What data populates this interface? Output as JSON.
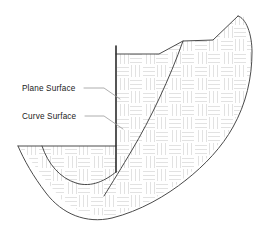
{
  "diagram": {
    "background_color": "#ffffff",
    "outline_color": "#4a4a4a",
    "emphasis_color": "#2b2b2b",
    "hatch_color": "#e2e2e2",
    "leader_color": "#9a9a9a",
    "labels": [
      {
        "id": "plane-surface",
        "text": "Plane Surface",
        "x": 22,
        "y": 91,
        "leader": "M 84 88 L 104 88 L 120 99"
      },
      {
        "id": "curve-surface",
        "text": "Curve Surface",
        "x": 22,
        "y": 119,
        "leader": "M 85 116 L 104 116 L 123 129"
      }
    ],
    "geometry": {
      "body_fill_outline": "M 18 146 L 116 146 L 116 54 L 159 54 L 183 41 L 213 40 L 238 16 L 245 17 L 252 44 L 250 76 L 243 104 L 228 133 L 205 160 L 176 185 L 142 206 L 112 216 L 84 214 L 62 200 L 44 178 L 28 157 Z",
      "plane_surface_line": {
        "path": "M 116 46 L 116 172",
        "width": 1.6,
        "color": "#2b2b2b"
      },
      "top_profile": {
        "path": "M 116 54 L 159 54 L 183 41 L 213 40 L 238 16",
        "color": "#4a4a4a"
      },
      "right_profile": {
        "path": "M 238 16 C 246 18 252 34 252 52 C 252 78 246 104 233 127 C 222 147 205 165 186 180",
        "color": "#4a4a4a"
      },
      "bottom_curve": {
        "path": "M 186 180 C 166 196 140 211 112 218 C 86 224 62 214 46 193 C 33 176 24 160 18 146",
        "color": "#4a4a4a"
      },
      "left_top_line": {
        "path": "M 18 146 L 116 146",
        "color": "#4a4a4a"
      },
      "curve_surface_major": {
        "path": "M 183 41 C 170 78 150 120 132 150 C 122 167 112 183 104 196",
        "color": "#4a4a4a"
      },
      "curve_surface_minor": {
        "path": "M 42 146 C 48 164 60 178 76 183 C 92 188 106 180 116 172",
        "color": "#4a4a4a"
      },
      "hatch_pattern": {
        "type": "basketweave",
        "tile_size": 26,
        "stroke_count": 3,
        "stroke_color": "#e2e2e2"
      }
    }
  }
}
